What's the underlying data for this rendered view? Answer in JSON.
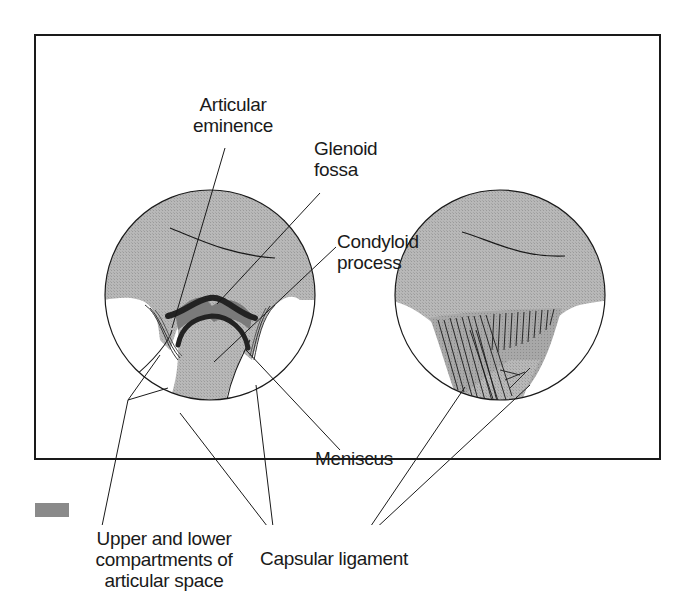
{
  "figure": {
    "colors": {
      "frame": "#1a1a1a",
      "bone_fill": "#b4b4b4",
      "meniscus_dark": "#2a2a2a",
      "meniscus_mid": "#7a7a7a",
      "background": "#ffffff"
    },
    "labels": {
      "articular_eminence": [
        "Articular",
        "eminence"
      ],
      "glenoid_fossa": [
        "Glenoid",
        "fossa"
      ],
      "condyloid_process": [
        "Condyloid",
        "process"
      ],
      "meniscus": "Meniscus",
      "compartments": [
        "Upper and lower",
        "compartments of",
        "articular space"
      ],
      "capsular_ligament": "Capsular ligament"
    },
    "panels": [
      {
        "name": "sagittal-section",
        "description": "cut-away showing meniscus and joint compartments"
      },
      {
        "name": "lateral-view",
        "description": "external view showing capsular ligament fibers"
      }
    ]
  }
}
